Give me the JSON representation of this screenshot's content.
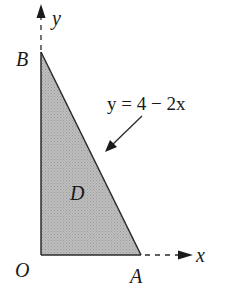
{
  "diagram": {
    "type": "region-in-plane",
    "axes": {
      "x_label": "x",
      "y_label": "y"
    },
    "points": {
      "origin": "O",
      "x_intercept": "A",
      "y_intercept": "B"
    },
    "region_label": "D",
    "curve_label": "y = 4 − 2x",
    "colors": {
      "region_fill": "#b3b3b3",
      "stroke": "#2a2a2a",
      "background": "#ffffff"
    }
  }
}
